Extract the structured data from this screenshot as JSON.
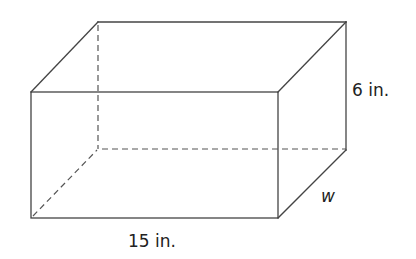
{
  "figure": {
    "labels": {
      "length": "15 in.",
      "height": "6 in.",
      "width": "w"
    },
    "dimensions": {
      "length": {
        "value": 15,
        "unit": "in."
      },
      "height": {
        "value": 6,
        "unit": "in."
      },
      "width": {
        "value": null,
        "variable": "w"
      }
    },
    "colors": {
      "edge": "#444444",
      "text": "#222222",
      "background": "#ffffff"
    }
  }
}
